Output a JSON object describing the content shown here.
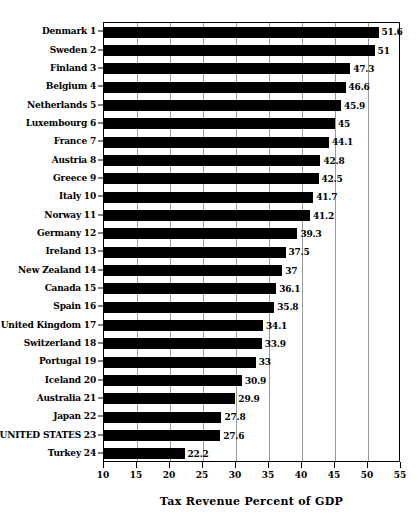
{
  "chart_data": {
    "type": "bar",
    "orientation": "horizontal",
    "title": "",
    "xlabel": "Tax Revenue Percent of GDP",
    "ylabel": "",
    "xlim": [
      10,
      55
    ],
    "xticks": [
      10,
      15,
      20,
      25,
      30,
      35,
      40,
      45,
      50,
      55
    ],
    "grid": true,
    "legend": null,
    "bar_color": "#000000",
    "categories": [
      "Denmark 1",
      "Sweden 2",
      "Finland 3",
      "Belgium 4",
      "Netherlands 5",
      "Luxembourg 6",
      "France 7",
      "Austria 8",
      "Greece 9",
      "Italy 10",
      "Norway 11",
      "Germany 12",
      "Ireland 13",
      "New Zealand 14",
      "Canada 15",
      "Spain 16",
      "United Kingdom 17",
      "Switzerland 18",
      "Portugal 19",
      "Iceland 20",
      "Australia 21",
      "Japan 22",
      "UNITED STATES 23",
      "Turkey 24"
    ],
    "values": [
      51.6,
      51,
      47.3,
      46.6,
      45.9,
      45,
      44.1,
      42.8,
      42.5,
      41.7,
      41.2,
      39.3,
      37.5,
      37,
      36.1,
      35.8,
      34.1,
      33.9,
      33,
      30.9,
      29.9,
      27.8,
      27.6,
      22.2
    ],
    "value_labels": [
      "51.6",
      "51",
      "47.3",
      "46.6",
      "45.9",
      "45",
      "44.1",
      "42.8",
      "42.5",
      "41.7",
      "41.2",
      "39.3",
      "37.5",
      "37",
      "36.1",
      "35.8",
      "34.1",
      "33.9",
      "33",
      "30.9",
      "29.9",
      "27.8",
      "27.6",
      "22.2"
    ]
  }
}
